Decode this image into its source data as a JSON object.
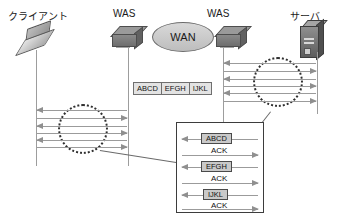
{
  "diagram": {
    "nodes": [
      {
        "id": "client",
        "label": "クライアント",
        "icon": "laptop-icon"
      },
      {
        "id": "was-left",
        "label": "WAS",
        "icon": "server-brick-icon"
      },
      {
        "id": "wan",
        "label": "WAN",
        "icon": "cloud-ellipse-icon"
      },
      {
        "id": "was-right",
        "label": "WAS",
        "icon": "server-brick-icon"
      },
      {
        "id": "server",
        "label": "サーバ",
        "icon": "server-tower-icon"
      }
    ],
    "packet_strip": {
      "name": "packet-strip",
      "cells": [
        "ABCD",
        "EFGH",
        "IJKL"
      ]
    },
    "left_exchange": {
      "name": "client-was-exchange",
      "arrow_count": 6,
      "directions": [
        "left",
        "right",
        "left",
        "right",
        "left",
        "right"
      ]
    },
    "right_exchange": {
      "name": "was-server-exchange",
      "arrow_count": 6,
      "directions": [
        "left",
        "right",
        "left",
        "right",
        "left",
        "right"
      ]
    },
    "detail_box": {
      "name": "detail-callout",
      "rows": [
        {
          "label": "ABCD",
          "direction": "left",
          "type": "data"
        },
        {
          "label": "ACK",
          "direction": "right",
          "type": "ack"
        },
        {
          "label": "EFGH",
          "direction": "left",
          "type": "data"
        },
        {
          "label": "ACK",
          "direction": "right",
          "type": "ack"
        },
        {
          "label": "IJKL",
          "direction": "left",
          "type": "data"
        },
        {
          "label": "ACK",
          "direction": "right",
          "type": "ack"
        }
      ]
    },
    "colors": {
      "arrow": "#9b9b9b",
      "focus_circle": "#2f2f2f",
      "label_fill": "#c9c9c9",
      "text": "#111111",
      "background": "#ffffff"
    }
  }
}
